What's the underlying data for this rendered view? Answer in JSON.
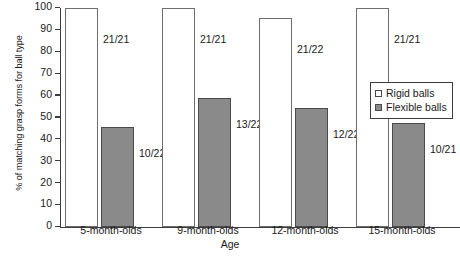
{
  "chart_data": {
    "type": "bar",
    "title": "",
    "xlabel": "Age",
    "ylabel": "% of matching grasp forms for ball type",
    "ylim": [
      0,
      100
    ],
    "ytick_step": 10,
    "yticks": [
      100,
      90,
      80,
      70,
      60,
      50,
      40,
      30,
      20,
      10,
      0
    ],
    "grid": false,
    "legend_position": "right",
    "categories": [
      "5-month-olds",
      "9-month-olds",
      "12-month-olds",
      "15-month-olds"
    ],
    "series": [
      {
        "name": "Rigid balls",
        "color": "#ffffff",
        "values": [
          100,
          100,
          95.5,
          100
        ],
        "labels": [
          "21/21",
          "21/21",
          "21/22",
          "21/21"
        ]
      },
      {
        "name": "Flexible balls",
        "color": "#8a8a8a",
        "values": [
          45.5,
          59.1,
          54.5,
          47.6
        ],
        "labels": [
          "10/22",
          "13/22",
          "12/22",
          "10/21"
        ]
      }
    ]
  },
  "legend": {
    "entries": [
      {
        "label": "Rigid balls",
        "swatch": "rigid-swatch-icon"
      },
      {
        "label": "Flexible balls",
        "swatch": "flexible-swatch-icon"
      }
    ]
  }
}
